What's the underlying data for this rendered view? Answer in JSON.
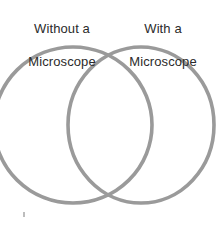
{
  "figure": {
    "type": "venn-diagram",
    "background_color": "#ffffff",
    "width": 221,
    "height": 226
  },
  "labels": {
    "left": {
      "line1": "Without a",
      "line2": "Microscope",
      "color": "#2b2b2b"
    },
    "right": {
      "line1": "With a",
      "line2": "Microscope",
      "color": "#2b2b2b"
    }
  },
  "circles": {
    "stroke_color": "#9a9a9a",
    "stroke_width": 3.6,
    "fill": "none",
    "left": {
      "cx": 73,
      "cy": 125,
      "rx": 79,
      "ry": 78
    },
    "right": {
      "cx": 141,
      "cy": 125,
      "rx": 73,
      "ry": 78
    }
  },
  "marks": {
    "stray_dot": {
      "color": "#bdbdbd",
      "x": 23,
      "y": 212
    }
  }
}
